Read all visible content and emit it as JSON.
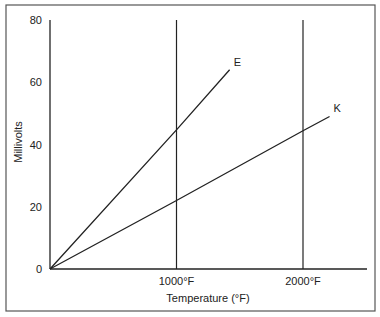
{
  "chart_data": {
    "type": "line",
    "title": "",
    "xlabel": "Temperature (°F)",
    "ylabel": "Millivolts",
    "xlim": [
      0,
      2300
    ],
    "ylim": [
      0,
      80
    ],
    "grid": false,
    "legend": "inline labels at line ends",
    "y_ticks": [
      0,
      20,
      40,
      60,
      80
    ],
    "x_ticks": [
      {
        "value": 1000,
        "label": "1000°F"
      },
      {
        "value": 2000,
        "label": "2000°F"
      }
    ],
    "reference_lines": [
      {
        "orientation": "vertical",
        "x": 1000
      },
      {
        "orientation": "vertical",
        "x": 2000
      }
    ],
    "series": [
      {
        "name": "E",
        "x": [
          0,
          1000,
          1420
        ],
        "y": [
          0,
          44.7,
          64
        ]
      },
      {
        "name": "K",
        "x": [
          0,
          1000,
          2000,
          2210
        ],
        "y": [
          0,
          22,
          44.4,
          49
        ]
      }
    ]
  }
}
